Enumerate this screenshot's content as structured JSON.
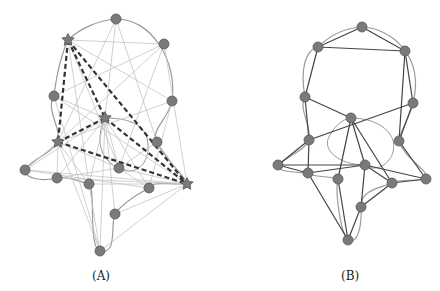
{
  "panels": [
    {
      "id": "A",
      "caption": "(A)",
      "caption_pos": [
        92,
        283
      ],
      "nodes": [
        {
          "x": 116,
          "y": 19,
          "shape": "circle"
        },
        {
          "x": 68,
          "y": 40,
          "shape": "star"
        },
        {
          "x": 164,
          "y": 44,
          "shape": "circle"
        },
        {
          "x": 54,
          "y": 96,
          "shape": "circle"
        },
        {
          "x": 172,
          "y": 101,
          "shape": "circle"
        },
        {
          "x": 105,
          "y": 118,
          "shape": "star"
        },
        {
          "x": 58,
          "y": 142,
          "shape": "star"
        },
        {
          "x": 157,
          "y": 142,
          "shape": "circle"
        },
        {
          "x": 187,
          "y": 184,
          "shape": "star"
        },
        {
          "x": 25,
          "y": 170,
          "shape": "circle"
        },
        {
          "x": 57,
          "y": 178,
          "shape": "circle"
        },
        {
          "x": 89,
          "y": 184,
          "shape": "circle"
        },
        {
          "x": 119,
          "y": 168,
          "shape": "circle"
        },
        {
          "x": 149,
          "y": 188,
          "shape": "circle"
        },
        {
          "x": 115,
          "y": 214,
          "shape": "circle"
        },
        {
          "x": 100,
          "y": 251,
          "shape": "circle"
        }
      ],
      "dashed_edges": [
        [
          1,
          5
        ],
        [
          1,
          6
        ],
        [
          1,
          8
        ],
        [
          5,
          6
        ],
        [
          5,
          8
        ],
        [
          6,
          8
        ]
      ],
      "light_edges": [
        [
          0,
          5
        ],
        [
          0,
          6
        ],
        [
          0,
          7
        ],
        [
          1,
          2
        ],
        [
          1,
          4
        ],
        [
          1,
          12
        ],
        [
          1,
          11
        ],
        [
          2,
          3
        ],
        [
          2,
          6
        ],
        [
          2,
          12
        ],
        [
          3,
          5
        ],
        [
          3,
          8
        ],
        [
          4,
          6
        ],
        [
          4,
          13
        ],
        [
          5,
          9
        ],
        [
          5,
          10
        ],
        [
          5,
          11
        ],
        [
          5,
          12
        ],
        [
          5,
          13
        ],
        [
          5,
          14
        ],
        [
          5,
          15
        ],
        [
          6,
          9
        ],
        [
          6,
          10
        ],
        [
          6,
          11
        ],
        [
          6,
          12
        ],
        [
          6,
          15
        ],
        [
          7,
          12
        ],
        [
          7,
          8
        ],
        [
          8,
          9
        ],
        [
          8,
          10
        ],
        [
          8,
          11
        ],
        [
          8,
          12
        ],
        [
          8,
          14
        ],
        [
          8,
          15
        ],
        [
          9,
          13
        ],
        [
          10,
          12
        ],
        [
          11,
          15
        ],
        [
          12,
          13
        ],
        [
          3,
          15
        ],
        [
          2,
          8
        ]
      ],
      "boundary_path": "M116,19 C150,18 178,60 172,101 C168,120 150,130 157,142 C165,160 185,175 187,184 C170,185 155,180 149,188 C142,192 125,200 115,214 C110,225 118,255 100,251 C88,248 96,190 89,184 C75,180 65,176 57,178 C40,182 25,178 25,170 C30,160 50,155 58,142 C62,128 45,110 54,96 C58,60 68,40 68,40 C80,28 100,20 116,19 Z",
      "loop_path": "M105,118 C130,118 150,125 148,150 C146,170 130,175 119,168 C100,160 95,140 105,118 Z"
    },
    {
      "id": "B",
      "caption": "(B)",
      "caption_pos": [
        341,
        283
      ],
      "nodes": [
        {
          "x": 362,
          "y": 27
        },
        {
          "x": 318,
          "y": 47
        },
        {
          "x": 405,
          "y": 51
        },
        {
          "x": 305,
          "y": 97
        },
        {
          "x": 413,
          "y": 103
        },
        {
          "x": 351,
          "y": 118
        },
        {
          "x": 309,
          "y": 140
        },
        {
          "x": 399,
          "y": 141
        },
        {
          "x": 278,
          "y": 165
        },
        {
          "x": 308,
          "y": 173
        },
        {
          "x": 338,
          "y": 179
        },
        {
          "x": 365,
          "y": 165
        },
        {
          "x": 392,
          "y": 183
        },
        {
          "x": 426,
          "y": 179
        },
        {
          "x": 361,
          "y": 207
        },
        {
          "x": 348,
          "y": 240
        }
      ],
      "dark_edges": [
        [
          0,
          1
        ],
        [
          0,
          2
        ],
        [
          1,
          2
        ],
        [
          1,
          3
        ],
        [
          2,
          4
        ],
        [
          2,
          7
        ],
        [
          3,
          5
        ],
        [
          3,
          6
        ],
        [
          4,
          6
        ],
        [
          4,
          7
        ],
        [
          5,
          10
        ],
        [
          5,
          11
        ],
        [
          5,
          12
        ],
        [
          6,
          8
        ],
        [
          6,
          9
        ],
        [
          7,
          13
        ],
        [
          8,
          9
        ],
        [
          8,
          11
        ],
        [
          9,
          11
        ],
        [
          9,
          15
        ],
        [
          10,
          15
        ],
        [
          11,
          12
        ],
        [
          11,
          13
        ],
        [
          11,
          14
        ],
        [
          12,
          13
        ],
        [
          12,
          14
        ],
        [
          14,
          15
        ]
      ],
      "boundary_path": "M362,27 C390,28 425,55 413,103 C410,118 400,130 399,141 C405,160 430,170 426,179 C410,182 400,178 392,183 C380,188 360,190 361,207 C362,225 358,245 348,240 C340,232 335,190 338,179 C325,175 315,178 308,173 C295,172 275,172 278,165 C290,155 305,150 309,140 C312,125 298,110 305,97 C300,70 305,50 318,47 C330,35 345,28 362,27 Z",
      "loop_path": "M351,118 C380,118 400,135 392,155 C385,170 370,170 365,165 C340,165 320,150 330,135 C335,125 345,118 351,118 Z"
    }
  ],
  "colors": {
    "node_fill": "#7a7a7a",
    "node_stroke": "#555555",
    "light_edge": "#c4c4c4",
    "dashed_edge": "#333333",
    "dark_edge": "#444444",
    "boundary": "#9a9a9a"
  }
}
